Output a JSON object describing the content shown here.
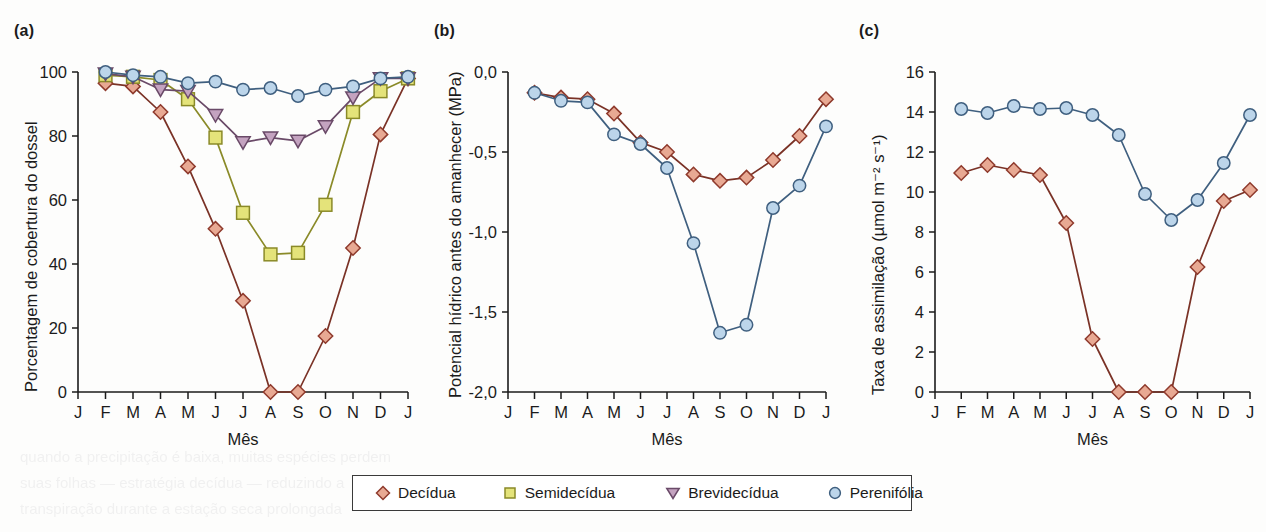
{
  "figure": {
    "panels": [
      {
        "id": "a",
        "label": "(a)",
        "ylabel": "Porcentagem de cobertura do dossel",
        "xlabel": "Mês"
      },
      {
        "id": "b",
        "label": "(b)",
        "ylabel": "Potencial hídrico antes do amanhecer (MPa)",
        "xlabel": "Mês"
      },
      {
        "id": "c",
        "label": "(c)",
        "ylabel": "Taxa de assimilação (µmol m⁻² s⁻¹)",
        "xlabel": "Mês"
      }
    ]
  },
  "legend": {
    "items": [
      {
        "label": "Decídua",
        "marker": "diamond-marker",
        "fill": "#e8a993",
        "stroke": "#8f3a2c"
      },
      {
        "label": "Semidecídua",
        "marker": "square-marker",
        "fill": "#e4e37a",
        "stroke": "#8a8a28"
      },
      {
        "label": "Brevidecídua",
        "marker": "triangle-down-marker",
        "fill": "#c4a3c0",
        "stroke": "#6a4a68"
      },
      {
        "label": "Perenifólia",
        "marker": "circle-marker",
        "fill": "#bcd5ea",
        "stroke": "#3f5f7f"
      }
    ]
  },
  "colors": {
    "decidua_fill": "#e8a993",
    "decidua_stroke": "#8f3a2c",
    "semidecidua_fill": "#e4e37a",
    "semidecidua_stroke": "#8a8a28",
    "brevidecidua_fill": "#c4a3c0",
    "brevidecidua_stroke": "#6a4a68",
    "perenifolia_fill": "#bcd5ea",
    "perenifolia_stroke": "#3f5f7f",
    "axis": "#1b1b1b",
    "text": "#1b1b1b",
    "background": "#fdfdfc"
  },
  "chart_data": [
    {
      "type": "line",
      "panel": "a",
      "title": "(a)",
      "xlabel": "Mês",
      "ylabel": "Porcentagem de cobertura do dossel",
      "categories": [
        "J",
        "F",
        "M",
        "A",
        "M",
        "J",
        "J",
        "A",
        "S",
        "O",
        "N",
        "D",
        "J"
      ],
      "ytick_labels": [
        "0",
        "20",
        "40",
        "60",
        "80",
        "100"
      ],
      "yticks": [
        0,
        20,
        40,
        60,
        80,
        100
      ],
      "ylim": [
        0,
        100
      ],
      "grid": false,
      "legend_position": "bottom-shared",
      "series": [
        {
          "name": "Decídua",
          "marker": "diamond",
          "values": [
            null,
            96.5,
            95.5,
            87.5,
            70.5,
            51,
            28.5,
            0,
            0,
            17.5,
            45,
            80.5,
            98
          ]
        },
        {
          "name": "Semidecídua",
          "marker": "square",
          "values": [
            null,
            99,
            98.5,
            97.5,
            91.5,
            79.5,
            56,
            43,
            43.5,
            58.5,
            87.5,
            94,
            98
          ]
        },
        {
          "name": "Brevidecídua",
          "marker": "triangle-down",
          "values": [
            null,
            99.5,
            98.5,
            94.5,
            94,
            86.5,
            78,
            79.5,
            78.5,
            83,
            92,
            98,
            98
          ]
        },
        {
          "name": "Perenifólia",
          "marker": "circle",
          "values": [
            null,
            100,
            99,
            98.5,
            96.5,
            97,
            94.5,
            95,
            92.5,
            94.5,
            95.5,
            98,
            98.5
          ]
        }
      ]
    },
    {
      "type": "line",
      "panel": "b",
      "title": "(b)",
      "xlabel": "Mês",
      "ylabel": "Potencial hídrico antes do amanhecer (MPa)",
      "categories": [
        "J",
        "F",
        "M",
        "A",
        "M",
        "J",
        "J",
        "A",
        "S",
        "O",
        "N",
        "D",
        "J"
      ],
      "ytick_labels": [
        "0,0",
        "-0,5",
        "-1,0",
        "-1,5",
        "-2,0"
      ],
      "yticks": [
        0.0,
        -0.5,
        -1.0,
        -1.5,
        -2.0
      ],
      "ylim": [
        -2.0,
        0.0
      ],
      "grid": false,
      "legend_position": "bottom-shared",
      "series": [
        {
          "name": "Decídua",
          "marker": "diamond",
          "values": [
            null,
            -0.13,
            -0.16,
            -0.17,
            -0.26,
            -0.44,
            -0.5,
            -0.64,
            -0.68,
            -0.66,
            -0.55,
            -0.4,
            -0.17
          ]
        },
        {
          "name": "Perenifólia",
          "marker": "circle",
          "values": [
            null,
            -0.13,
            -0.18,
            -0.19,
            -0.39,
            -0.45,
            -0.6,
            -1.07,
            -1.63,
            -1.58,
            -0.85,
            -0.71,
            -0.34
          ]
        }
      ]
    },
    {
      "type": "line",
      "panel": "c",
      "title": "(c)",
      "xlabel": "Mês",
      "ylabel": "Taxa de assimilação (µmol m⁻² s⁻¹)",
      "categories": [
        "J",
        "F",
        "M",
        "A",
        "M",
        "J",
        "J",
        "A",
        "S",
        "O",
        "N",
        "D",
        "J"
      ],
      "ytick_labels": [
        "0",
        "2",
        "4",
        "6",
        "8",
        "10",
        "12",
        "14",
        "16"
      ],
      "yticks": [
        0,
        2,
        4,
        6,
        8,
        10,
        12,
        14,
        16
      ],
      "ylim": [
        0,
        16
      ],
      "grid": false,
      "legend_position": "bottom-shared",
      "series": [
        {
          "name": "Decídua",
          "marker": "diamond",
          "values": [
            null,
            10.95,
            11.35,
            11.1,
            10.85,
            8.45,
            2.65,
            0,
            0,
            0,
            6.25,
            9.55,
            10.1
          ]
        },
        {
          "name": "Perenifólia",
          "marker": "circle",
          "values": [
            null,
            14.15,
            13.95,
            14.3,
            14.15,
            14.2,
            13.85,
            12.85,
            9.9,
            8.6,
            9.6,
            11.45,
            13.85
          ]
        }
      ]
    }
  ]
}
